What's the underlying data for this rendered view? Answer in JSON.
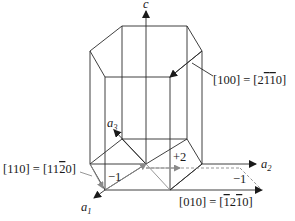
{
  "diagram": {
    "axes": {
      "c": "c",
      "a1": "a",
      "a1_sub": "1",
      "a2": "a",
      "a2_sub": "2",
      "a3": "a",
      "a3_sub": "3"
    },
    "annotations": {
      "dir_100_left": "[100] = [2",
      "dir_100_bar1": "1",
      "dir_100_bar2": "1",
      "dir_100_end": "0]",
      "dir_110_left": "[110] = [11",
      "dir_110_bar": "2",
      "dir_110_end": "0]",
      "dir_010_left": "[010] = [",
      "dir_010_bar1": "1",
      "dir_010_mid": "2",
      "dir_010_bar2": "1",
      "dir_010_end": "0]",
      "step_minus1_a1": "−1",
      "step_plus2": "+2",
      "step_minus1_a2": "−1"
    },
    "colors": {
      "edge": "#2a2a2a",
      "construction": "#8a8a8a",
      "text": "#1a1a1a"
    }
  }
}
